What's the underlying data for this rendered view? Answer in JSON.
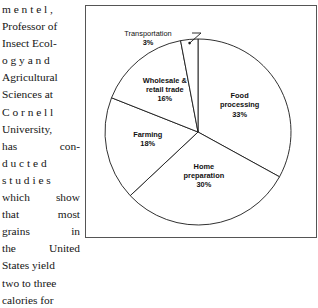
{
  "article": {
    "lines": [
      {
        "text": "m e n t e l ,",
        "justify": false
      },
      {
        "text": "Professor of",
        "justify": false
      },
      {
        "text": "Insect Ecol-",
        "justify": false
      },
      {
        "text": "o g y  a n d",
        "justify": false
      },
      {
        "text": "Agricultural",
        "justify": false
      },
      {
        "text": "Sciences at",
        "justify": false
      },
      {
        "text": "C o r n e l l",
        "justify": false
      },
      {
        "text": "University,",
        "justify": false
      },
      {
        "text": "has  con-",
        "justify": true,
        "words": [
          "has",
          "con-"
        ]
      },
      {
        "text": "d u c t e d",
        "justify": false
      },
      {
        "text": "s t u d i e s",
        "justify": false
      },
      {
        "text": "which show",
        "justify": true,
        "words": [
          "which",
          "show"
        ]
      },
      {
        "text": "that  most",
        "justify": true,
        "words": [
          "that",
          "most"
        ]
      },
      {
        "text": "grains  in",
        "justify": true,
        "words": [
          "grains",
          "in"
        ]
      },
      {
        "text": "the United",
        "justify": true,
        "words": [
          "the",
          "United"
        ]
      },
      {
        "text": "States yield",
        "justify": false
      },
      {
        "text": "two to three",
        "justify": false
      },
      {
        "text": "calories for",
        "justify": false
      }
    ]
  },
  "chart_data": {
    "type": "pie",
    "title": "",
    "legend": "none",
    "start_angle_deg": -90,
    "direction": "clockwise",
    "categories": [
      "Food processing",
      "Home preparation",
      "Farming",
      "Wholesale & retail trade",
      "Transportation"
    ],
    "values": [
      33,
      30,
      18,
      16,
      3
    ],
    "total": 100,
    "unit": "%",
    "slices": [
      {
        "name": "Food processing",
        "label_lines": [
          "Food",
          "processing"
        ],
        "value": 33,
        "value_label": "33%",
        "label_placement": "inside",
        "label_r": 0.52
      },
      {
        "name": "Home preparation",
        "label_lines": [
          "Home",
          "preparation"
        ],
        "value": 30,
        "value_label": "30%",
        "label_placement": "inside",
        "label_r": 0.5
      },
      {
        "name": "Farming",
        "label_lines": [
          "Farming"
        ],
        "value": 18,
        "value_label": "18%",
        "label_placement": "inside",
        "label_r": 0.55
      },
      {
        "name": "Wholesale & retail trade",
        "label_lines": [
          "Wholesale &",
          "retail trade"
        ],
        "value": 16,
        "value_label": "16%",
        "label_placement": "inside",
        "label_r": 0.56
      },
      {
        "name": "Transportation",
        "label_lines": [
          "Transportation"
        ],
        "value": 3,
        "value_label": "3%",
        "label_placement": "callout",
        "callout": {
          "text_x": 62,
          "text_y": 30,
          "elbow_x": 115,
          "elbow_y": 27,
          "point_x": 115,
          "point_y": 52
        }
      }
    ],
    "geometry": {
      "cx": 112,
      "cy": 126,
      "r": 93
    },
    "colors": {
      "slice_fill": "#ffffff",
      "slice_stroke": "#1a1a1a",
      "frame": "#555555",
      "text": "#111111"
    }
  }
}
